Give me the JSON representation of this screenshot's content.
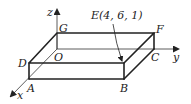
{
  "diagram": {
    "axes": {
      "x_label": "x",
      "y_label": "y",
      "z_label": "z",
      "origin_label": "O"
    },
    "vertices": {
      "A": "A",
      "B": "B",
      "C": "C",
      "D": "D",
      "F": "F",
      "G": "G"
    },
    "annotation": {
      "text": "E(4, 6, 1)",
      "point": "E",
      "coordinates": [
        4,
        6,
        1
      ]
    }
  }
}
